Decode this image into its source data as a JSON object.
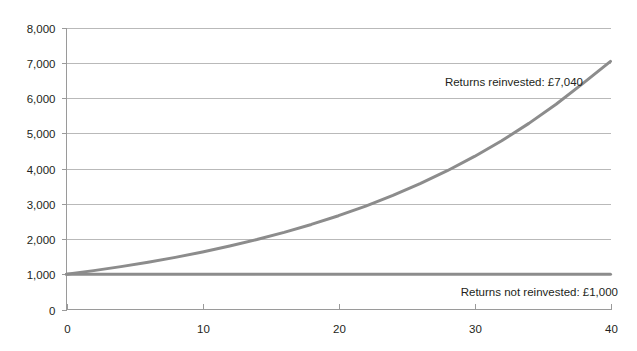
{
  "chart_data": {
    "type": "line",
    "title": "",
    "subtitle": "",
    "xlabel": "",
    "ylabel": "",
    "xlim": [
      0,
      40
    ],
    "ylim": [
      0,
      8000
    ],
    "grid": true,
    "legend_position": "inline-annotations",
    "x_ticks": [
      "0",
      "10",
      "20",
      "30",
      "40"
    ],
    "x_tick_values": [
      0,
      10,
      20,
      30,
      40
    ],
    "y_ticks": [
      "0",
      "1,000",
      "2,000",
      "3,000",
      "4,000",
      "5,000",
      "6,000",
      "7,000",
      "8,000"
    ],
    "y_tick_values": [
      0,
      1000,
      2000,
      3000,
      4000,
      5000,
      6000,
      7000,
      8000
    ],
    "x": [
      0,
      2,
      4,
      6,
      8,
      10,
      12,
      14,
      16,
      18,
      20,
      22,
      24,
      26,
      28,
      30,
      32,
      34,
      36,
      38,
      40
    ],
    "series": [
      {
        "name": "Returns reinvested",
        "color": "#8c8c8c",
        "final_value": 7040,
        "values": [
          1000,
          1103,
          1216,
          1341,
          1479,
          1631,
          1799,
          1984,
          2188,
          2413,
          2661,
          2935,
          3237,
          3570,
          3937,
          4342,
          4788,
          5280,
          5823,
          6422,
          7040
        ]
      },
      {
        "name": "Returns not reinvested",
        "color": "#8c8c8c",
        "final_value": 1000,
        "values": [
          1000,
          1000,
          1000,
          1000,
          1000,
          1000,
          1000,
          1000,
          1000,
          1000,
          1000,
          1000,
          1000,
          1000,
          1000,
          1000,
          1000,
          1000,
          1000,
          1000,
          1000
        ]
      }
    ],
    "annotations": [
      {
        "text": "Returns reinvested: £7,040",
        "x_px": 583,
        "y_px": 86
      },
      {
        "text": "Returns not reinvested: £1,000",
        "x_px": 618,
        "y_px": 296
      }
    ],
    "colors": {
      "line": "#8c8c8c",
      "grid": "#b9b9b9",
      "axis": "#9a9a9a",
      "text": "#231f20",
      "background": "#ffffff"
    }
  }
}
